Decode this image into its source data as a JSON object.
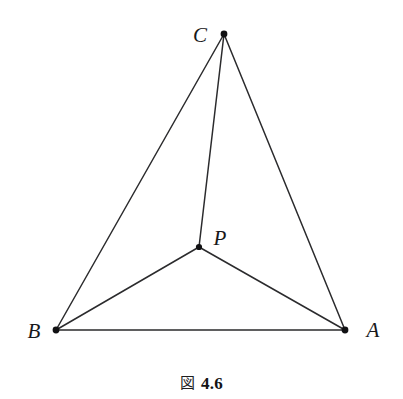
{
  "figure": {
    "caption_cjk": "図",
    "caption_number": "4.6",
    "background_color": "#ffffff",
    "stroke_color": "#2b2b2d",
    "vertex_dot_color": "#111113"
  },
  "labels": {
    "a": "A",
    "b": "B",
    "c": "C",
    "p": "P"
  },
  "chart_data": {
    "type": "scatter",
    "title": "図 4.6",
    "xlabel": "",
    "ylabel": "",
    "xlim": [
      0,
      403
    ],
    "ylim": [
      0,
      399
    ],
    "grid": false,
    "legend": "none",
    "points": [
      {
        "name": "A",
        "label": "A",
        "x": 345,
        "y": 330,
        "label_x": 373,
        "label_y": 330
      },
      {
        "name": "B",
        "label": "B",
        "x": 56,
        "y": 330,
        "label_x": 34,
        "label_y": 331
      },
      {
        "name": "C",
        "label": "C",
        "x": 224,
        "y": 34,
        "label_x": 200,
        "label_y": 35
      },
      {
        "name": "P",
        "label": "P",
        "x": 199,
        "y": 247,
        "label_x": 220,
        "label_y": 238
      }
    ],
    "segments": [
      {
        "name": "BA",
        "from": "B",
        "to": "A"
      },
      {
        "name": "BC",
        "from": "B",
        "to": "C"
      },
      {
        "name": "CA",
        "from": "C",
        "to": "A"
      },
      {
        "name": "PC",
        "from": "P",
        "to": "C"
      },
      {
        "name": "PB",
        "from": "P",
        "to": "B"
      },
      {
        "name": "PA",
        "from": "P",
        "to": "A"
      }
    ]
  }
}
